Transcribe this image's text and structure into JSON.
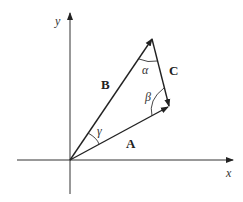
{
  "diagram": {
    "axes": {
      "x_label": "x",
      "y_label": "y"
    },
    "vectors": [
      {
        "name": "A",
        "label": "A",
        "from": "origin",
        "to": "right vertex"
      },
      {
        "name": "B",
        "label": "B",
        "from": "origin",
        "to": "top vertex"
      },
      {
        "name": "C",
        "label": "C",
        "from": "top vertex",
        "to": "right vertex"
      }
    ],
    "angles": [
      {
        "name": "alpha",
        "label": "α",
        "at": "top vertex"
      },
      {
        "name": "beta",
        "label": "β",
        "at": "right vertex"
      },
      {
        "name": "gamma",
        "label": "γ",
        "at": "origin"
      }
    ],
    "colors": {
      "stroke": "#222222",
      "background": "#ffffff"
    }
  }
}
